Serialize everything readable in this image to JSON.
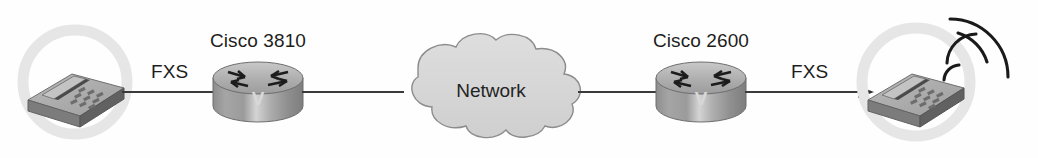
{
  "diagram": {
    "background_color": "#fefefe",
    "line_color": "#3a3a3a",
    "cloud_fill": "#d6d6d6",
    "cloud_stroke": "#8a8a8a",
    "router_body_color": "#9a9a9a",
    "router_top_color": "#b4b4b4",
    "phone_body_color": "#8d8d8d",
    "halo_color": "#e6e6e6",
    "nodes": [
      {
        "id": "phone-left",
        "type": "analog-phone",
        "label": "",
        "x": 75,
        "y": 88,
        "ringing": false
      },
      {
        "id": "router-left",
        "type": "cisco-router",
        "label": "Cisco 3810",
        "face_letter": "V",
        "x": 258,
        "y": 92
      },
      {
        "id": "cloud",
        "type": "network-cloud",
        "label": "Network",
        "x": 490,
        "y": 90
      },
      {
        "id": "router-right",
        "type": "cisco-router",
        "label": "Cisco 2600",
        "face_letter": "V",
        "x": 701,
        "y": 92
      },
      {
        "id": "phone-right",
        "type": "analog-phone",
        "label": "",
        "x": 910,
        "y": 88,
        "ringing": true
      }
    ],
    "links": [
      {
        "id": "link-phone-left-router-left",
        "from": "phone-left",
        "to": "router-left",
        "label": "FXS",
        "arrow": false
      },
      {
        "id": "link-router-left-cloud",
        "from": "router-left",
        "to": "cloud",
        "label": "",
        "arrow": false
      },
      {
        "id": "link-cloud-router-right",
        "from": "cloud",
        "to": "router-right",
        "label": "",
        "arrow": false
      },
      {
        "id": "link-router-right-phone-right",
        "from": "router-right",
        "to": "phone-right",
        "label": "FXS",
        "arrow": true
      }
    ],
    "labels": {
      "fxs_left": "FXS",
      "fxs_right": "FXS",
      "router_left": "Cisco 3810",
      "router_right": "Cisco 2600",
      "cloud": "Network",
      "router_left_face": "V",
      "router_right_face": "V"
    },
    "ring_waves": {
      "count": 4,
      "origin_x": 952,
      "origin_y": 96
    }
  }
}
